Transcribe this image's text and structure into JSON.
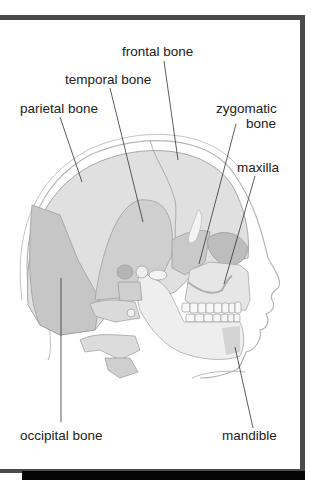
{
  "figure": {
    "frame_color": "#4a4a4a",
    "bone_fill": "#d9d9d9",
    "bone_shade": "#bdbdbd",
    "outline_color": "#9a9a9a",
    "labels": [
      {
        "id": "frontal",
        "text": "frontal bone"
      },
      {
        "id": "temporal",
        "text": "temporal bone"
      },
      {
        "id": "parietal",
        "text": "parietal bone"
      },
      {
        "id": "zygomatic_line1",
        "text": "zygomatic"
      },
      {
        "id": "zygomatic_line2",
        "text": "bone"
      },
      {
        "id": "maxilla",
        "text": "maxilla"
      },
      {
        "id": "occipital",
        "text": "occipital bone"
      },
      {
        "id": "mandible",
        "text": "mandible"
      }
    ]
  }
}
